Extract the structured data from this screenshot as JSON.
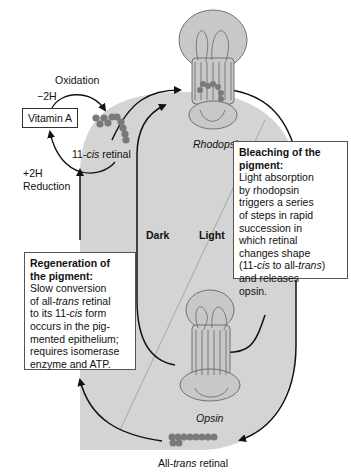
{
  "diagram": {
    "labels": {
      "oxidation": "Oxidation",
      "minus_2h": "−2H",
      "plus_2h": "+2H",
      "reduction": "Reduction",
      "vitamin_a": "Vitamin A",
      "cis_prefix": "11-",
      "cis_italic": "cis",
      "cis_suffix": " retinal",
      "rhodopsin": "Rhodopsin",
      "opsin": "Opsin",
      "dark": "Dark",
      "light": "Light",
      "trans_prefix": "All-",
      "trans_italic": "trans",
      "trans_suffix": " retinal"
    },
    "bleaching_box": {
      "title": "Bleaching of the pigment:",
      "lines": [
        "Light absorption",
        "by rhodopsin",
        "triggers a series",
        "of steps in rapid",
        "succession in",
        "which retinal",
        "changes shape"
      ],
      "line8_a": "(11-",
      "line8_b": "cis",
      "line8_c": " to all-",
      "line8_d": "trans",
      "line8_e": ")",
      "lines_end": [
        "and releases",
        "opsin."
      ]
    },
    "regeneration_box": {
      "title_1": "Regeneration of",
      "title_2": "the pigment:",
      "line1": "Slow conversion",
      "line2_a": "of all-",
      "line2_b": "trans",
      "line2_c": " retinal",
      "line3_a": "to its 11-",
      "line3_b": "cis",
      "line3_c": " form",
      "line4": "occurs in the pig-",
      "line5": "mented epithelium;",
      "line6": "requires isomerase",
      "line7": "enzyme and ATP."
    },
    "colors": {
      "cycle_fill": "#d4d4d4",
      "molecule": "#7a7a7a",
      "protein_fill": "#c8c8c8",
      "line": "#111111"
    }
  }
}
